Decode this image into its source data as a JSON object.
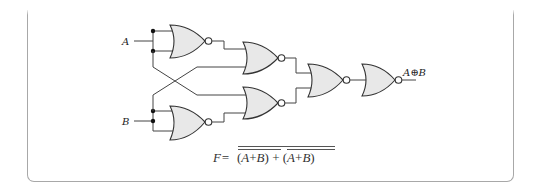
{
  "diagram": {
    "type": "logic-circuit",
    "title": "",
    "inputs": [
      {
        "id": "A",
        "label": "A"
      },
      {
        "id": "B",
        "label": "B"
      }
    ],
    "gates": [
      {
        "id": "g1",
        "type": "NOR",
        "inputs": [
          "A",
          "A"
        ],
        "output": "not A"
      },
      {
        "id": "g2",
        "type": "NOR",
        "inputs": [
          "g1",
          "B"
        ],
        "output": "(A' + B)'"
      },
      {
        "id": "g3",
        "type": "NOR",
        "inputs": [
          "A",
          "g4"
        ],
        "output": "(A + B')'"
      },
      {
        "id": "g4",
        "type": "NOR",
        "inputs": [
          "B",
          "B"
        ],
        "output": "not B"
      },
      {
        "id": "g5",
        "type": "NOR",
        "inputs": [
          "g2",
          "g3"
        ]
      },
      {
        "id": "g6",
        "type": "NOR",
        "inputs": [
          "g5"
        ]
      }
    ],
    "output": {
      "label": "A⊕B"
    },
    "formula": {
      "lhs": "F=",
      "term1_open": "(",
      "term1_a": "A",
      "term1_plus": "+",
      "term1_b": "B",
      "term1_close": ")",
      "join": "+",
      "term2_open": "(",
      "term2_a": "A",
      "term2_plus": "+",
      "term2_b": "B",
      "term2_close": ")"
    },
    "colors": {
      "gate_fill": "#e8e8e8",
      "stroke": "#333333",
      "frame": "#a8a8a8"
    }
  }
}
